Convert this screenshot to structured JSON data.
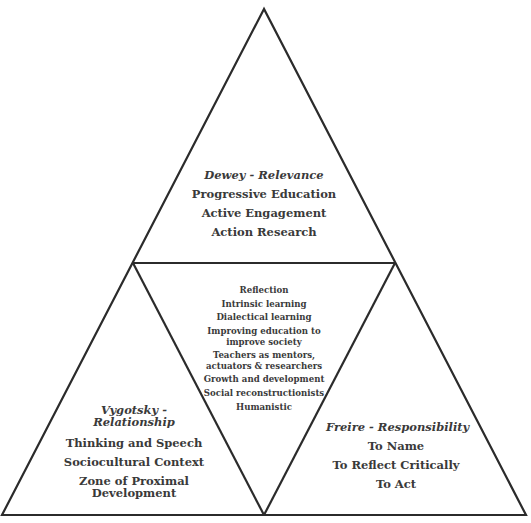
{
  "diagram": {
    "type": "triangle-of-triangles",
    "colors": {
      "stroke": "#2b2b2b",
      "text": "#3a3a3a",
      "background": "#ffffff"
    },
    "top": {
      "title": "Dewey - Relevance",
      "items": [
        "Progressive Education",
        "Active Engagement",
        "Action Research"
      ]
    },
    "center": {
      "items": [
        "Reflection",
        "Intrinsic learning",
        "Dialectical learning",
        "Improving education to",
        "improve society",
        "Teachers as mentors,",
        "actuators & researchers",
        "Growth and development",
        "Social reconstructionists",
        "Humanistic"
      ]
    },
    "left": {
      "title_line1": "Vygotsky -",
      "title_line2": "Relationship",
      "items": [
        "Thinking and Speech",
        "Sociocultural Context",
        "Zone of Proximal",
        "Development"
      ]
    },
    "right": {
      "title": "Freire - Responsibility",
      "items": [
        "To Name",
        "To Reflect Critically",
        "To Act"
      ]
    }
  }
}
